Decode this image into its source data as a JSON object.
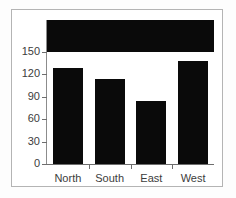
{
  "chart_data": {
    "type": "bar",
    "title": "",
    "subtitle": "",
    "xlabel": "",
    "ylabel": "",
    "categories": [
      "North",
      "South",
      "East",
      "West"
    ],
    "values": [
      130,
      115,
      86,
      139
    ],
    "ylim": [
      0,
      150
    ],
    "yticks": [
      0,
      30,
      60,
      90,
      120,
      150
    ],
    "ytick_labels": [
      "0",
      "30",
      "60",
      "90",
      "120",
      "150"
    ],
    "grid": false,
    "legend": null,
    "annotations": [],
    "colors": {
      "bar_fill": "#0a0a0a",
      "axis": "#6e6e6e",
      "tick_text": "#3c3c3c",
      "plot_background": "#ffffff",
      "overflow_band": "#0a0a0a",
      "figure_frame": "#b4b4b4",
      "figure_background": "#fdfdfd"
    }
  }
}
